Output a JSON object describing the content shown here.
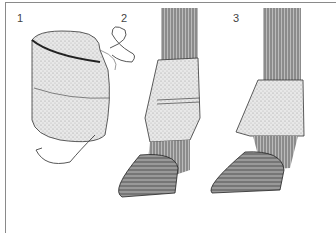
{
  "figure": {
    "panels": [
      {
        "label": "1",
        "subject": "rolled fleece bandage with tie strings"
      },
      {
        "label": "2",
        "subject": "bandage wrapped and tied on horse lower leg"
      },
      {
        "label": "3",
        "subject": "bandage top folded down over the tie"
      }
    ],
    "colors": {
      "ink": "#222222",
      "border": "#8a8a8a",
      "background": "#ffffff"
    }
  }
}
